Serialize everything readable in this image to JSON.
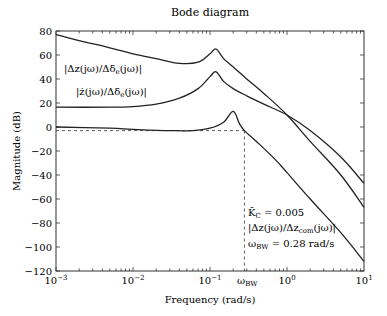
{
  "chart_data": {
    "type": "line",
    "title": "Bode diagram",
    "xlabel": "Frequency (rad/s)",
    "ylabel": "Magnitude (dB)",
    "xscale": "log",
    "xlim": [
      0.001,
      10
    ],
    "ylim": [
      -120,
      80
    ],
    "x_ticks": [
      "10^-3",
      "10^-2",
      "10^-1",
      "10^0",
      "10^1"
    ],
    "y_ticks": [
      80,
      60,
      40,
      20,
      0,
      -20,
      -40,
      -60,
      -80,
      -100,
      -120
    ],
    "grid": false,
    "series": [
      {
        "name": "|Δz(jω)/Δδe(jω)|",
        "x": [
          0.001,
          0.002,
          0.005,
          0.01,
          0.02,
          0.04,
          0.07,
          0.1,
          0.12,
          0.15,
          0.2,
          0.3,
          0.5,
          1.0,
          2.0,
          5.0,
          10.0
        ],
        "y": [
          77,
          72,
          66,
          61,
          57,
          53,
          54,
          61,
          65,
          57,
          50,
          40,
          28,
          10,
          -12,
          -40,
          -67
        ]
      },
      {
        "name": "|ż(jω)/Δδe(jω)|",
        "x": [
          0.001,
          0.005,
          0.01,
          0.02,
          0.04,
          0.07,
          0.1,
          0.12,
          0.15,
          0.2,
          0.3,
          0.5,
          1.0,
          2.0,
          5.0,
          10.0
        ],
        "y": [
          16.5,
          16.5,
          17,
          19,
          24,
          32,
          42,
          46,
          38,
          32,
          26,
          19,
          10,
          -3,
          -25,
          -47
        ]
      },
      {
        "name": "|Δz(jω)/Δzcom(jω)|",
        "x": [
          0.001,
          0.005,
          0.01,
          0.03,
          0.06,
          0.1,
          0.15,
          0.2,
          0.24,
          0.28,
          0.4,
          0.7,
          1.0,
          2.0,
          5.0,
          10.0
        ],
        "y": [
          0,
          -1,
          -2,
          -3,
          -3,
          -1,
          4,
          13,
          3,
          -3,
          -12,
          -27,
          -38,
          -60,
          -88,
          -112
        ]
      }
    ],
    "annotations": [
      {
        "text": "|Δz(jω)/Δδe(jω)|",
        "x": 0.0013,
        "y": 46
      },
      {
        "text": "|ż(jω)/Δδe(jω)|",
        "x": 0.002,
        "y": 28
      },
      {
        "text": "K̄C = 0.005",
        "x": 0.3,
        "y": -88
      },
      {
        "text": "|Δz(jω)/Δzcom(jω)|",
        "x": 0.3,
        "y": -96
      },
      {
        "text": "ωBW = 0.28 rad/s",
        "x": 0.3,
        "y": -106
      },
      {
        "text": "ωBW",
        "x": 0.28,
        "y": -128
      }
    ],
    "reference_lines": {
      "horizontal_dB": -3,
      "vertical_omega": 0.28
    }
  },
  "labels": {
    "title": "Bode diagram",
    "xlabel": "Frequency (rad/s)",
    "ylabel": "Magnitude (dB)",
    "xticks": [
      "10",
      "10",
      "10",
      "10",
      "10"
    ],
    "xexp": [
      "−3",
      "−2",
      "−1",
      "0",
      "1"
    ],
    "yticks": [
      "80",
      "60",
      "40",
      "20",
      "0",
      "−20",
      "−40",
      "−60",
      "−80",
      "−100",
      "−120"
    ],
    "omega_bw_label_main": "ω",
    "omega_bw_label_sub": "BW",
    "ann_dz": "|Δz(jω)/Δδ",
    "ann_dz_sub": "e",
    "ann_dz_end": "(jω)|",
    "ann_zdot": "|ż(jω)/Δδ",
    "ann_zdot_sub": "e",
    "ann_zdot_end": "(jω)|",
    "ann_kc": "K̄",
    "ann_kc_sub": "C",
    "ann_kc_end": " = 0.005",
    "ann_tf": "|Δz(jω)/Δz",
    "ann_tf_sub": "com",
    "ann_tf_end": "(jω)|",
    "ann_bw": "ω",
    "ann_bw_sub": "BW",
    "ann_bw_end": " = 0.28 rad/s"
  }
}
